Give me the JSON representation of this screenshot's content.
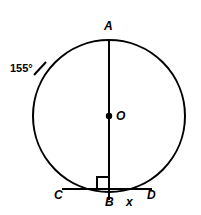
{
  "figure": {
    "stroke_color": "#000000",
    "background_color": "#ffffff"
  },
  "labels": {
    "point_a": "A",
    "point_o": "O",
    "point_b": "B",
    "point_c": "C",
    "point_d": "D",
    "segment_x": "x",
    "arc_angle": "155°"
  },
  "geometry": {
    "circle": {
      "cx": 109,
      "cy": 116,
      "r": 76
    },
    "center_dot": {
      "cx": 109,
      "cy": 116,
      "r": 3
    },
    "diameter_ab": {
      "x1": 109,
      "y1": 40,
      "x2": 109,
      "y2": 199
    },
    "chord_cd": {
      "x1": 62,
      "y1": 189,
      "x2": 152,
      "y2": 189
    },
    "right_angle_marker": {
      "x": 97,
      "y": 177,
      "size": 12
    },
    "arc_tick": {
      "x1": 35,
      "y1": 74,
      "x2": 46,
      "y2": 62
    }
  }
}
